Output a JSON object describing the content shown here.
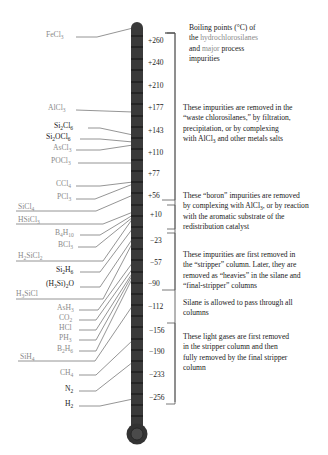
{
  "title": "Boiling points (°C) of the hydrochlorosilanes and major process impurities",
  "legend": {
    "line1": "Boiling points (°C) of",
    "line2_prefix": "the ",
    "line2_gray": "hydrochlorosilanes",
    "line3_prefix": "and ",
    "line3_gray": "major",
    "line3_suffix": " process",
    "line4": "impurities"
  },
  "scale_labels": [
    "+260",
    "+240",
    "+210",
    "+177",
    "+143",
    "+110",
    "+77",
    "+56",
    "+10",
    "−23",
    "−57",
    "−90",
    "−112",
    "−156",
    "−190",
    "−233",
    "−256"
  ],
  "compounds": [
    {
      "name": "FeCl3",
      "display": "FeCl",
      "sub": "3",
      "class": "impurity",
      "bp": "+315"
    },
    {
      "name": "AlCl3",
      "display": "AlCl",
      "sub": "3",
      "class": "impurity",
      "bp": "+177"
    },
    {
      "name": "Si2Cl6",
      "display": "Si",
      "sub": "2",
      "display2": "Cl",
      "sub2": "6",
      "class": "hydrochlorosilane",
      "bp": "+143"
    },
    {
      "name": "Si2OCl6",
      "display": "Si",
      "sub": "2",
      "display2": "OCl",
      "sub2": "6",
      "class": "hydrochlorosilane",
      "bp": "+137"
    },
    {
      "name": "AsCl3",
      "display": "AsCl",
      "sub": "3",
      "class": "impurity",
      "bp": "+130"
    },
    {
      "name": "POCl3",
      "display": "POCl",
      "sub": "3",
      "class": "impurity",
      "bp": "+105"
    },
    {
      "name": "CCl4",
      "display": "CCl",
      "sub": "4",
      "class": "impurity",
      "bp": "+77"
    },
    {
      "name": "PCl3",
      "display": "PCl",
      "sub": "3",
      "class": "impurity",
      "bp": "+76"
    },
    {
      "name": "SiCl4",
      "display": "SiCl",
      "sub": "4",
      "class": "hydrochlorosilane",
      "bp": "+57"
    },
    {
      "name": "HSiCl3",
      "display": "HSiCl",
      "sub": "3",
      "class": "hydrochlorosilane",
      "bp": "+32"
    },
    {
      "name": "B4H10",
      "display": "B",
      "sub": "4",
      "display2": "H",
      "sub2": "10",
      "class": "impurity",
      "bp": "+18"
    },
    {
      "name": "BCl3",
      "display": "BCl",
      "sub": "3",
      "class": "impurity",
      "bp": "+12"
    },
    {
      "name": "H2SiCl2",
      "display": "H",
      "sub": "2",
      "display2": "SiCl",
      "sub2": "2",
      "class": "hydrochlorosilane",
      "bp": "+8"
    },
    {
      "name": "Si2H6",
      "display": "Si",
      "sub": "2",
      "display2": "H",
      "sub2": "6",
      "class": "hydrochlorosilane",
      "bp": "−14"
    },
    {
      "name": "(H3Si)2O",
      "display": "(H",
      "sub": "3",
      "display2": "Si)",
      "sub2": "2",
      "display3": "O",
      "class": "hydrochlorosilane",
      "bp": "−15"
    },
    {
      "name": "H3SiCl",
      "display": "H",
      "sub": "3",
      "display2": "SiCl",
      "class": "hydrochlorosilane",
      "bp": "−30"
    },
    {
      "name": "AsH3",
      "display": "AsH",
      "sub": "3",
      "class": "impurity",
      "bp": "−62"
    },
    {
      "name": "CO2",
      "display": "CO",
      "sub": "2",
      "class": "impurity",
      "bp": "−78"
    },
    {
      "name": "HCl",
      "display": "HCl",
      "class": "impurity",
      "bp": "−85"
    },
    {
      "name": "PH3",
      "display": "PH",
      "sub": "3",
      "class": "impurity",
      "bp": "−88"
    },
    {
      "name": "B2H6",
      "display": "B",
      "sub": "2",
      "display2": "H",
      "sub2": "6",
      "class": "impurity",
      "bp": "−93"
    },
    {
      "name": "SiH4",
      "display": "SiH",
      "sub": "4",
      "class": "hydrochlorosilane",
      "bp": "−112"
    },
    {
      "name": "CH4",
      "display": "CH",
      "sub": "4",
      "class": "impurity",
      "bp": "−162"
    },
    {
      "name": "N2",
      "display": "N",
      "sub": "2",
      "class": "gas",
      "bp": "−196"
    },
    {
      "name": "H2",
      "display": "H",
      "sub": "2",
      "class": "gas",
      "bp": "−253"
    }
  ],
  "notes": [
    {
      "id": "waste",
      "text_parts": [
        "These impurities are removed in the",
        "“waste chlorosilanes,” by filtration,",
        "precipitation, or by complexing",
        "with AlCl",
        "3",
        " and other metals salts"
      ]
    },
    {
      "id": "boron",
      "text_parts": [
        "These “boron” impurities are removed",
        "by complexing with AlCl",
        "3",
        ", or by reaction",
        "with the aromatic substrate of the",
        "redistribution catalyst"
      ]
    },
    {
      "id": "heavies",
      "text_parts": [
        "These impurities are first removed in",
        "the “stripper” column. Later, they are",
        "removed as “heavies” in the silane and",
        "“final-stripper” columns"
      ]
    },
    {
      "id": "silane",
      "text_parts": [
        "Silane is allowed to pass through all",
        "columns"
      ]
    },
    {
      "id": "light",
      "text_parts": [
        "These light gases are first removed",
        "in the stripper column and then",
        "fully removed by the final stripper",
        "column"
      ]
    }
  ],
  "colors": {
    "thermometer": "#3a3a3a",
    "thermometer_dark": "#222222",
    "tick": "#111111",
    "leader_line": "#777777",
    "hydrochlorosilane_label": "#8a8a8a",
    "impurity_label": "#8a8a8a",
    "gas_label": "#1a1a1a",
    "text": "#1a1a1a"
  }
}
